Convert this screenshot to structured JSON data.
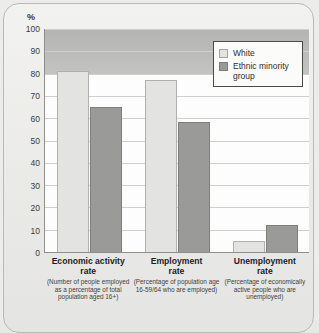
{
  "chart_data": {
    "type": "bar",
    "title": "",
    "xlabel": "",
    "ylabel": "%",
    "ylim": [
      0,
      100
    ],
    "ytick_step": 10,
    "yticks": [
      100,
      90,
      80,
      70,
      60,
      50,
      40,
      30,
      20,
      10,
      0
    ],
    "grid": true,
    "legend_position": "top-right",
    "categories": [
      "Economic activity rate",
      "Employment rate",
      "Unemployment rate"
    ],
    "category_labels": [
      {
        "title_line1": "Economic activity",
        "title_line2": "rate",
        "desc": "(Number of people employed as a percentage of total population aged 16+)"
      },
      {
        "title_line1": "Employment",
        "title_line2": "rate",
        "desc": "(Percentage of population age 16-59/64 who are employed)"
      },
      {
        "title_line1": "Unemployment",
        "title_line2": "rate",
        "desc": "(Percentage of economically active people who are unemployed)"
      }
    ],
    "series": [
      {
        "name": "White",
        "color": "#e3e3e1",
        "values": [
          81,
          77,
          5
        ]
      },
      {
        "name": "Ethnic minority group",
        "color": "#9a9a98",
        "values": [
          65,
          58.5,
          12
        ]
      }
    ]
  },
  "legend": {
    "items": [
      {
        "label": "White"
      },
      {
        "label": "Ethnic minority group"
      }
    ]
  },
  "colors": {
    "white_series": "#e3e3e1",
    "minority_series": "#9a9a98",
    "axis": "#8e8e8c",
    "gridline": "#cfcfcd",
    "shade_band": "#bdbdbb",
    "page_background": "#ececeb"
  }
}
